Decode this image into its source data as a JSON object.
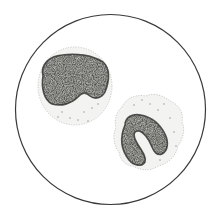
{
  "canvas": {
    "width": 213,
    "height": 215,
    "background": "#ffffff"
  },
  "field": {
    "cx": 110.5,
    "cy": 109.5,
    "r": 95,
    "stroke": "#3a3a3a",
    "stroke_width": 1.2,
    "fill": "#ffffff"
  },
  "colors": {
    "cytoplasm_fill": "#f3f3f1",
    "cytoplasm_stroke": "#bdbdb8",
    "nucleus_fill": "#9a9a96",
    "nucleus_dark": "#2e2e2c",
    "nucleus_light": "#e6e6e2",
    "granule": "#8a8a86"
  },
  "cells": [
    {
      "name": "monocyte-cell-upper-left",
      "cytoplasm": {
        "cx": 75,
        "cy": 86,
        "rx": 37,
        "ry": 39
      },
      "nucleus_path": "M43,76 C40,64 50,56 62,55 C76,53 92,55 103,62 C110,68 110,80 105,92 C102,98 95,100 90,96 C86,92 82,92 78,97 C72,103 62,107 52,104 C44,100 41,88 43,76 Z",
      "granules": [
        [
          62,
          112
        ],
        [
          70,
          118
        ],
        [
          84,
          112
        ],
        [
          92,
          108
        ],
        [
          78,
          120
        ],
        [
          58,
          117
        ],
        [
          98,
          104
        ],
        [
          88,
          121
        ]
      ]
    },
    {
      "name": "monocyte-cell-lower-right",
      "cytoplasm_path": "M122,107 C126,98 136,94 146,96 C154,92 164,96 170,101 C178,104 184,112 182,122 C186,130 182,140 178,146 C176,156 168,164 158,166 C150,172 140,170 133,166 C126,166 120,160 119,152 C114,146 112,136 116,128 C114,120 116,112 122,107 Z",
      "nucleus_path": "M125,125 C125,117 133,113 141,115 C151,117 160,124 165,134 C169,142 168,151 162,154 C157,156 154,152 152,147 C149,139 143,131 138,131 C133,131 133,137 137,143 C141,150 147,157 145,162 C142,167 134,166 129,160 C122,151 119,139 125,125 Z",
      "granules": [
        [
          150,
          104
        ],
        [
          158,
          110
        ],
        [
          170,
          118
        ],
        [
          134,
          105
        ],
        [
          174,
          132
        ],
        [
          164,
          104
        ],
        [
          142,
          100
        ],
        [
          176,
          146
        ],
        [
          160,
          160
        ]
      ]
    }
  ]
}
